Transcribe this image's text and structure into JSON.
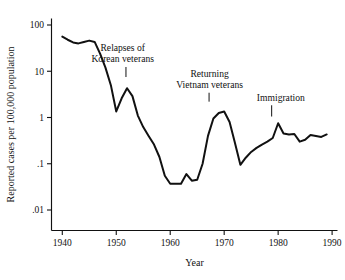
{
  "chart_data": {
    "type": "line",
    "title": "",
    "subtitle": "",
    "xlabel": "Year",
    "ylabel": "Reported cases per 100,000 population",
    "yscale": "log",
    "xscale": "linear",
    "xlim": [
      1938,
      1991
    ],
    "ylim": [
      0.01,
      100
    ],
    "grid": false,
    "legend": null,
    "legend_position": "none",
    "x_ticks": [
      1940,
      1950,
      1960,
      1970,
      1980,
      1990
    ],
    "x_tick_labels": [
      "1940",
      "1950",
      "1960",
      "1970",
      "1980",
      "1990"
    ],
    "y_ticks": [
      0.01,
      0.1,
      1,
      10,
      100
    ],
    "y_tick_labels": [
      ".01",
      ".1",
      "1",
      "10",
      "100"
    ],
    "series": [
      {
        "name": "Reported cases per 100,000 population",
        "color": "#111111",
        "x": [
          1940,
          1941,
          1942,
          1943,
          1944,
          1945,
          1946,
          1947,
          1948,
          1949,
          1950,
          1951,
          1952,
          1953,
          1954,
          1955,
          1956,
          1957,
          1958,
          1959,
          1960,
          1961,
          1962,
          1963,
          1964,
          1965,
          1966,
          1967,
          1968,
          1969,
          1970,
          1971,
          1972,
          1973,
          1974,
          1975,
          1976,
          1977,
          1978,
          1979,
          1980,
          1981,
          1982,
          1983,
          1984,
          1985,
          1986,
          1987,
          1988,
          1989
        ],
        "values": [
          56,
          48,
          42,
          40,
          43,
          46,
          43,
          24,
          12,
          5.0,
          1.35,
          2.6,
          4.3,
          2.9,
          1.1,
          0.62,
          0.4,
          0.26,
          0.14,
          0.055,
          0.037,
          0.037,
          0.037,
          0.06,
          0.043,
          0.045,
          0.1,
          0.4,
          0.95,
          1.25,
          1.35,
          0.8,
          0.28,
          0.095,
          0.135,
          0.18,
          0.22,
          0.26,
          0.3,
          0.36,
          0.75,
          0.45,
          0.43,
          0.44,
          0.3,
          0.33,
          0.42,
          0.4,
          0.38,
          0.43
        ]
      }
    ],
    "annotations": [
      {
        "label_lines": [
          "Relapses of",
          "Korean veterans"
        ],
        "text_x": 1951.2,
        "text_y_top": 27,
        "pointer_x": 1951.8,
        "pointer_y_value": 7.5
      },
      {
        "label_lines": [
          "Returning",
          "Vietnam veterans"
        ],
        "text_x": 1967.3,
        "text_y_top": 7.5,
        "pointer_x": 1967.2,
        "pointer_y_value": 2.2
      },
      {
        "label_lines": [
          "Immigration"
        ],
        "text_x": 1980.5,
        "text_y_top": 2.3,
        "pointer_x": 1978.8,
        "pointer_y_value": 1.05
      }
    ]
  }
}
